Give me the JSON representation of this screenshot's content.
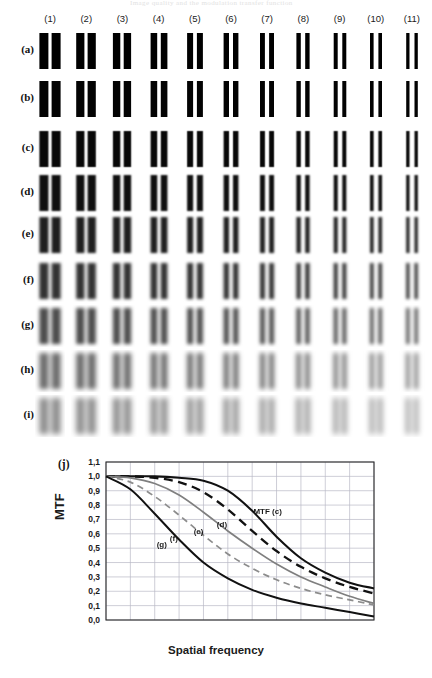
{
  "figure": {
    "running_head": "Image quality and the modulation transfer function",
    "columns": [
      "(1)",
      "(2)",
      "(3)",
      "(4)",
      "(5)",
      "(6)",
      "(7)",
      "(8)",
      "(9)",
      "(10)",
      "(11)"
    ],
    "rows": [
      "(a)",
      "(b)",
      "(c)",
      "(d)",
      "(e)",
      "(f)",
      "(g)",
      "(h)",
      "(i)"
    ],
    "panel_label": "(j)",
    "bar_pattern": {
      "bars_per_cell": 2,
      "row_blur_px": [
        0.0,
        0.6,
        1.6,
        2.6,
        3.6,
        4.8,
        6.0,
        7.4,
        9.0
      ],
      "row_contrast": [
        1.0,
        0.99,
        0.97,
        0.94,
        0.88,
        0.8,
        0.7,
        0.58,
        0.46
      ],
      "column_bar_width_px": [
        9.0,
        8.2,
        7.4,
        6.6,
        6.0,
        5.4,
        4.9,
        4.4,
        4.0,
        3.6,
        3.3
      ],
      "column_gap_px": [
        3.2,
        3.2,
        3.4,
        3.6,
        3.8,
        4.0,
        4.2,
        4.4,
        4.6,
        4.8,
        5.0
      ],
      "ink_color": "#101010",
      "paper_color": "#ffffff"
    }
  },
  "chart_data": {
    "type": "line",
    "title": "",
    "subtitle": "",
    "xlabel": "Spatial frequency",
    "ylabel": "MTF",
    "xlim": [
      0,
      11
    ],
    "ylim": [
      0.0,
      1.1
    ],
    "grid": true,
    "legend_position": "inline-annotations",
    "xticks": [
      0,
      1,
      2,
      3,
      4,
      5,
      6,
      7,
      8,
      9,
      10,
      11
    ],
    "xticklabels": [
      "",
      "",
      "",
      "",
      "",
      "",
      "",
      "",
      "",
      "",
      "",
      ""
    ],
    "yticks": [
      0.0,
      0.1,
      0.2,
      0.3,
      0.4,
      0.5,
      0.6,
      0.7,
      0.8,
      0.9,
      1.0,
      1.1
    ],
    "yticklabels": [
      "0,0",
      "0,1",
      "0,2",
      "0,3",
      "0,4",
      "0,5",
      "0,6",
      "0,7",
      "0,8",
      "0,9",
      "1,0",
      "1,1"
    ],
    "x": [
      0,
      1,
      2,
      3,
      4,
      5,
      6,
      7,
      8,
      9,
      10,
      11
    ],
    "series": [
      {
        "name": "MTF (c)",
        "label": "MTF (c)",
        "style": "solid",
        "color": "#111111",
        "width": 2.1,
        "values": [
          1.0,
          1.0,
          1.0,
          0.99,
          0.97,
          0.9,
          0.76,
          0.58,
          0.43,
          0.33,
          0.26,
          0.22
        ],
        "label_x": 6.05,
        "label_y": 0.755
      },
      {
        "name": "(d)",
        "label": "(d)",
        "style": "dashed",
        "color": "#111111",
        "width": 2.3,
        "values": [
          1.0,
          1.0,
          0.99,
          0.96,
          0.89,
          0.77,
          0.62,
          0.48,
          0.37,
          0.29,
          0.23,
          0.185
        ],
        "label_x": 4.55,
        "label_y": 0.66
      },
      {
        "name": "(e)",
        "label": "(e)",
        "style": "solid",
        "color": "#7f7f7f",
        "width": 1.7,
        "values": [
          1.0,
          0.99,
          0.95,
          0.87,
          0.75,
          0.62,
          0.5,
          0.39,
          0.3,
          0.23,
          0.165,
          0.115
        ],
        "label_x": 3.6,
        "label_y": 0.615
      },
      {
        "name": "(f)",
        "label": "(f)",
        "style": "dashed",
        "color": "#8c8c8c",
        "width": 1.7,
        "values": [
          1.0,
          0.96,
          0.86,
          0.73,
          0.59,
          0.46,
          0.36,
          0.28,
          0.22,
          0.175,
          0.14,
          0.105
        ]
      },
      {
        "name": "(g)",
        "label": "(g)",
        "style": "solid",
        "color": "#111111",
        "width": 2.0,
        "values": [
          1.0,
          0.91,
          0.74,
          0.56,
          0.4,
          0.29,
          0.21,
          0.155,
          0.115,
          0.085,
          0.055,
          0.025
        ],
        "label_x": 2.08,
        "label_y": 0.525
      }
    ],
    "annotations": [
      {
        "text": "(f)",
        "x": 2.62,
        "y": 0.565
      }
    ]
  }
}
